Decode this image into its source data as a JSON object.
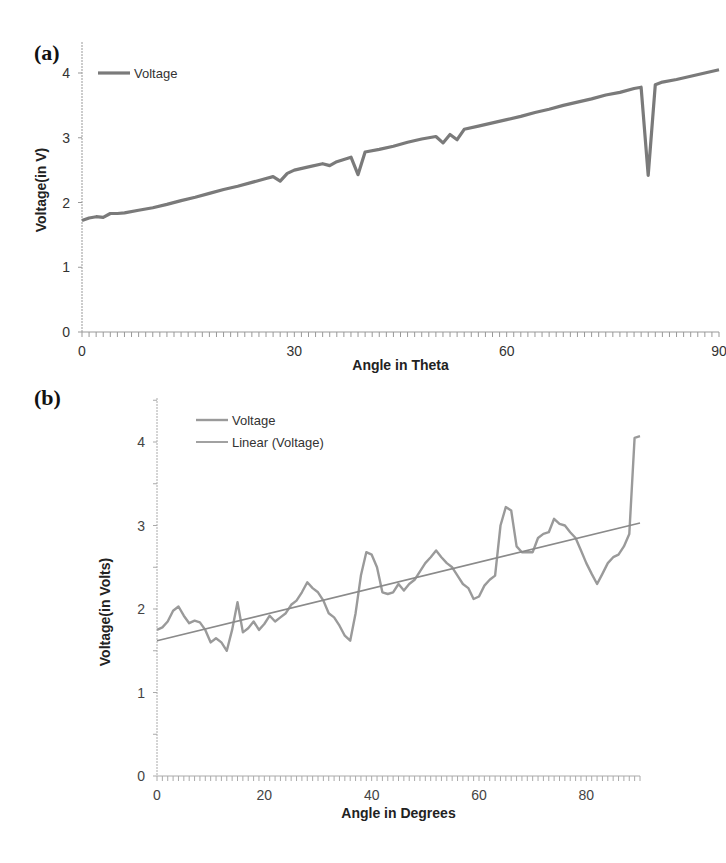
{
  "figure": {
    "panel_a_label": "(a)",
    "panel_b_label": "(b)"
  },
  "chart_data": [
    {
      "type": "line",
      "panel": "(a)",
      "title": "",
      "xlabel": "Angle in Theta",
      "ylabel": "Voltage(in V)",
      "xlim": [
        0,
        90
      ],
      "ylim": [
        0,
        4
      ],
      "xticks": [
        0,
        30,
        60,
        90
      ],
      "yticks": [
        0,
        1,
        2,
        3,
        4
      ],
      "grid": false,
      "legend": {
        "position": "top-left",
        "entries": [
          "Voltage"
        ]
      },
      "series": [
        {
          "name": "Voltage",
          "color": "#7a7a7a",
          "x": [
            0,
            1,
            2,
            3,
            4,
            5,
            6,
            8,
            10,
            12,
            14,
            16,
            18,
            20,
            22,
            24,
            26,
            27,
            28,
            29,
            30,
            32,
            34,
            35,
            36,
            38,
            39,
            40,
            42,
            44,
            46,
            48,
            50,
            51,
            52,
            53,
            54,
            56,
            58,
            60,
            62,
            64,
            66,
            68,
            70,
            72,
            74,
            76,
            78,
            79,
            80,
            81,
            82,
            84,
            86,
            88,
            90
          ],
          "values": [
            1.72,
            1.76,
            1.78,
            1.77,
            1.83,
            1.83,
            1.84,
            1.88,
            1.92,
            1.97,
            2.03,
            2.08,
            2.14,
            2.2,
            2.25,
            2.31,
            2.37,
            2.4,
            2.33,
            2.45,
            2.5,
            2.55,
            2.6,
            2.57,
            2.63,
            2.7,
            2.43,
            2.78,
            2.82,
            2.87,
            2.93,
            2.98,
            3.02,
            2.92,
            3.05,
            2.97,
            3.13,
            3.18,
            3.23,
            3.28,
            3.33,
            3.39,
            3.44,
            3.5,
            3.55,
            3.6,
            3.66,
            3.7,
            3.76,
            3.78,
            2.42,
            3.82,
            3.86,
            3.9,
            3.95,
            4.0,
            4.05
          ]
        }
      ]
    },
    {
      "type": "line",
      "panel": "(b)",
      "title": "",
      "xlabel": "Angle in Degrees",
      "ylabel": "Voltage(in Volts)",
      "xlim": [
        0,
        90
      ],
      "ylim": [
        0,
        4.5
      ],
      "xticks": [
        0,
        20,
        40,
        60,
        80
      ],
      "yticks": [
        0,
        1,
        2,
        3,
        4
      ],
      "grid": false,
      "legend": {
        "position": "top-left",
        "entries": [
          "Voltage",
          "Linear (Voltage)"
        ]
      },
      "series": [
        {
          "name": "Voltage",
          "color": "#9a9a9a",
          "x": [
            0,
            1,
            2,
            3,
            4,
            5,
            6,
            7,
            8,
            9,
            10,
            11,
            12,
            13,
            14,
            15,
            16,
            17,
            18,
            19,
            20,
            21,
            22,
            23,
            24,
            25,
            26,
            27,
            28,
            29,
            30,
            31,
            32,
            33,
            34,
            35,
            36,
            37,
            38,
            39,
            40,
            41,
            42,
            43,
            44,
            45,
            46,
            47,
            48,
            49,
            50,
            51,
            52,
            53,
            54,
            55,
            56,
            57,
            58,
            59,
            60,
            61,
            62,
            63,
            64,
            65,
            66,
            67,
            68,
            69,
            70,
            71,
            72,
            73,
            74,
            75,
            76,
            77,
            78,
            79,
            80,
            81,
            82,
            83,
            84,
            85,
            86,
            87,
            88,
            89,
            90
          ],
          "values": [
            1.75,
            1.78,
            1.85,
            1.98,
            2.03,
            1.92,
            1.83,
            1.86,
            1.84,
            1.75,
            1.6,
            1.65,
            1.6,
            1.5,
            1.75,
            2.08,
            1.72,
            1.77,
            1.85,
            1.75,
            1.82,
            1.92,
            1.85,
            1.9,
            1.95,
            2.05,
            2.1,
            2.2,
            2.32,
            2.25,
            2.2,
            2.1,
            1.95,
            1.9,
            1.8,
            1.68,
            1.62,
            1.95,
            2.4,
            2.68,
            2.65,
            2.5,
            2.2,
            2.18,
            2.2,
            2.3,
            2.22,
            2.3,
            2.35,
            2.45,
            2.55,
            2.62,
            2.7,
            2.62,
            2.55,
            2.5,
            2.4,
            2.3,
            2.25,
            2.12,
            2.15,
            2.28,
            2.35,
            2.4,
            3.0,
            3.22,
            3.18,
            2.75,
            2.68,
            2.68,
            2.68,
            2.85,
            2.9,
            2.92,
            3.08,
            3.02,
            3.0,
            2.92,
            2.85,
            2.7,
            2.55,
            2.42,
            2.3,
            2.42,
            2.55,
            2.62,
            2.65,
            2.75,
            2.9,
            4.05,
            4.07
          ]
        },
        {
          "name": "Linear (Voltage)",
          "color": "#8a8a8a",
          "x": [
            0,
            90
          ],
          "values": [
            1.62,
            3.03
          ]
        }
      ]
    }
  ]
}
